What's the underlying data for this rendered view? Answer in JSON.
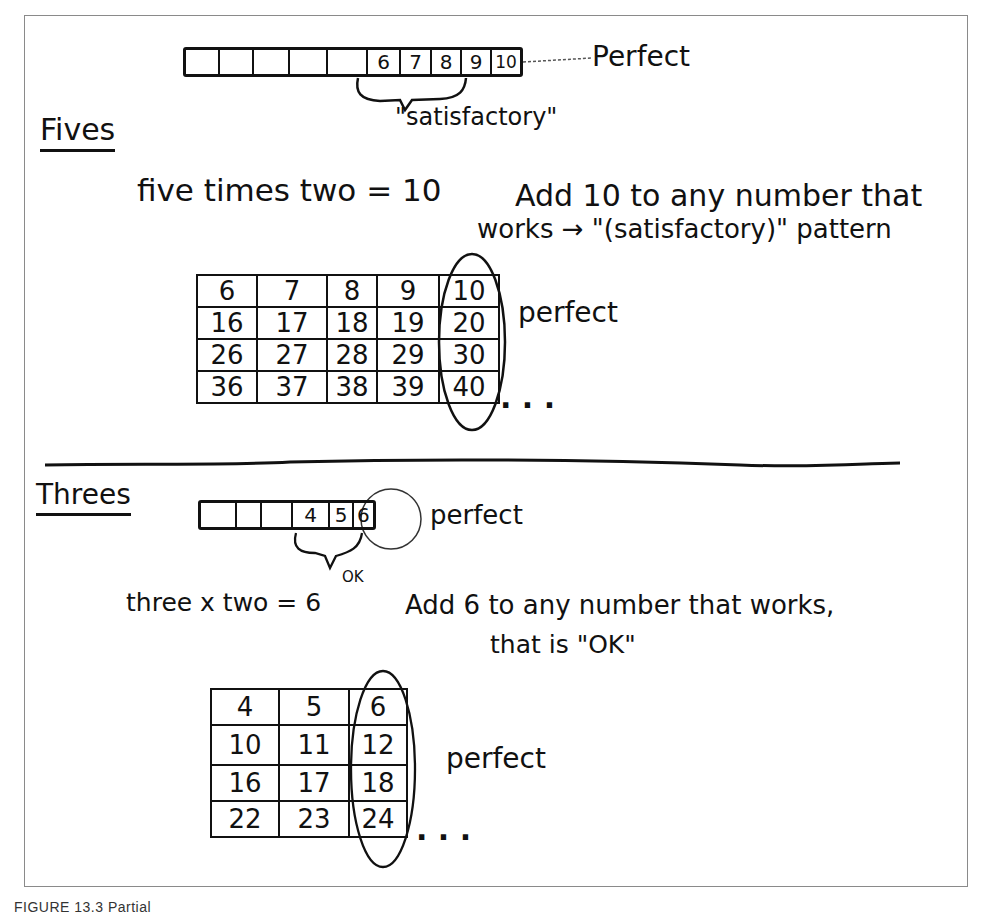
{
  "fives": {
    "heading": "Fives",
    "strip_cells": [
      "",
      "",
      "",
      "",
      "",
      "6",
      "7",
      "8",
      "9",
      "10"
    ],
    "strip_perfect_label": "Perfect",
    "strip_satisfactory_label": "\"satisfactory\"",
    "rule_line1_left": "five times two = 10",
    "rule_line1_right": "Add 10 to any number that",
    "rule_line2": "works → \"(satisfactory)\" pattern",
    "grid": [
      [
        "6",
        "7",
        "8",
        "9",
        "10"
      ],
      [
        "16",
        "17",
        "18",
        "19",
        "20"
      ],
      [
        "26",
        "27",
        "28",
        "29",
        "30"
      ],
      [
        "36",
        "37",
        "38",
        "39",
        "40"
      ]
    ],
    "grid_perfect_label": "perfect",
    "ellipsis": ". . ."
  },
  "threes": {
    "heading": "Threes",
    "strip_cells": [
      "",
      "",
      "",
      "4",
      "5",
      "6"
    ],
    "strip_perfect_label": "perfect",
    "strip_ok_label": "OK",
    "rule_line1_left": "three x two = 6",
    "rule_line1_right": "Add 6 to any number that works,",
    "rule_line2": "that is \"OK\"",
    "grid": [
      [
        "4",
        "5",
        "6"
      ],
      [
        "10",
        "11",
        "12"
      ],
      [
        "16",
        "17",
        "18"
      ],
      [
        "22",
        "23",
        "24"
      ]
    ],
    "grid_perfect_label": "perfect",
    "ellipsis": ". . ."
  },
  "caption": "FIGURE 13.3  Partial"
}
